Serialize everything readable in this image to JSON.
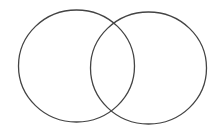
{
  "diagram": {
    "type": "venn",
    "background": "#ffffff",
    "stroke_color": "#444444",
    "stroke_width": 1.3,
    "sets": [
      {
        "id": "left-set",
        "cx": 76.5,
        "cy": 66,
        "rx": 58,
        "ry": 56,
        "label": ""
      },
      {
        "id": "right-set",
        "cx": 148.5,
        "cy": 68,
        "rx": 58,
        "ry": 56,
        "label": ""
      }
    ]
  }
}
